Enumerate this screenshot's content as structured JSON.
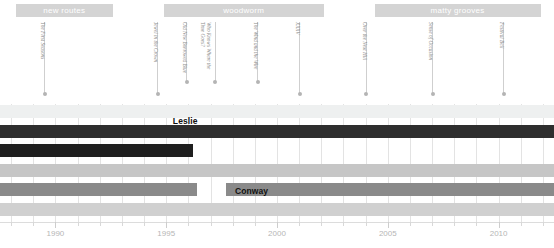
{
  "chart_data": {
    "type": "bar",
    "title": "",
    "xlabel": "",
    "ylabel": "",
    "orientation": "horizontal",
    "grid": true,
    "legend_position": "none",
    "xlim": [
      1987.5,
      2012.5
    ],
    "x_ticks_major": [
      1990,
      1995,
      2000,
      2005,
      2010
    ],
    "x_tick_labels": [
      "1990",
      "1995",
      "2000",
      "2005",
      "2010"
    ],
    "x_ticks_minor": [
      1988,
      1989,
      1991,
      1992,
      1993,
      1994,
      1996,
      1997,
      1998,
      1999,
      2001,
      2002,
      2003,
      2004,
      2006,
      2007,
      2008,
      2009,
      2011,
      2012
    ],
    "eras": [
      {
        "label": "new routes",
        "start": 1988.2,
        "end": 1992.6,
        "color": "#d4d4d4"
      },
      {
        "label": "woodworm",
        "start": 1994.9,
        "end": 2002.1,
        "color": "#d4d4d4"
      },
      {
        "label": "matty grooves",
        "start": 2004.4,
        "end": 2011.9,
        "color": "#d4d4d4"
      }
    ],
    "annotations": [
      {
        "label": "The First Seasons",
        "x": 1989.5,
        "lines": 1,
        "leader_height": 72
      },
      {
        "label": "Jewel in the Crown",
        "x": 1994.6,
        "lines": 1,
        "leader_height": 72
      },
      {
        "label": "Old New Borrowed Blue",
        "x": 1995.9,
        "lines": 1,
        "leader_height": 60
      },
      {
        "label": "Who Knows Where the\nTime Goes?",
        "x": 1997.2,
        "lines": 2,
        "leader_height": 60
      },
      {
        "label": "The Wind and the Wire",
        "x": 1999.1,
        "lines": 1,
        "leader_height": 60
      },
      {
        "label": "XXXV",
        "x": 2001.0,
        "lines": 1,
        "leader_height": 72
      },
      {
        "label": "Over the Next Hill",
        "x": 2004.0,
        "lines": 1,
        "leader_height": 72
      },
      {
        "label": "Sense of Occasion",
        "x": 2007.0,
        "lines": 1,
        "leader_height": 72
      },
      {
        "label": "Festival Bell",
        "x": 2010.2,
        "lines": 1,
        "leader_height": 72
      }
    ],
    "series": [
      {
        "name": "",
        "start": 1987.5,
        "end": 2012.5,
        "color": "#eef0f0",
        "row": 0,
        "label_visible": false
      },
      {
        "name": "Leslie",
        "start": 1987.5,
        "end": 2012.5,
        "color": "#2e2e2e",
        "row": 1,
        "label_visible": true,
        "label_x": 1995.3,
        "label_color": "#111111"
      },
      {
        "name": "",
        "start": 1987.5,
        "end": 1996.2,
        "color": "#1f1f1f",
        "row": 2,
        "label_visible": false
      },
      {
        "name": "",
        "start": 1987.5,
        "end": 2012.5,
        "color": "#c6c6c6",
        "row": 3,
        "label_visible": false
      },
      {
        "name": "Conway",
        "start": 1987.5,
        "end": 2012.5,
        "color": "#8a8a8a",
        "row": 4,
        "label_visible": true,
        "label_x": 1998.1,
        "label_color": "#111111",
        "gap_start": 1996.4,
        "gap_end": 1997.7
      },
      {
        "name": "",
        "start": 1987.5,
        "end": 2012.5,
        "color": "#d0d0d0",
        "row": 5,
        "label_visible": false
      }
    ],
    "row_count": 6,
    "colors": {
      "background": "#ffffff",
      "gridline": "#e3e3e3",
      "era_bar": "#d4d4d4",
      "era_text": "#ffffff",
      "annotation_text": "#8a8a8a",
      "leader_line": "#cfcfcf",
      "axis_text": "#b6b6b6"
    }
  }
}
